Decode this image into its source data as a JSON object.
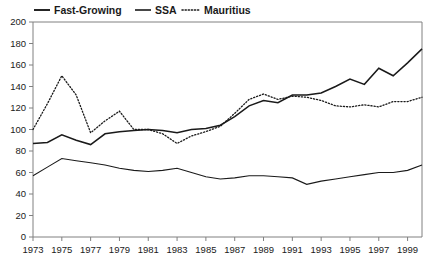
{
  "chart_data": {
    "type": "line",
    "title": "",
    "subtitle": "",
    "xlabel": "",
    "ylabel": "",
    "xlim": [
      1973,
      2000
    ],
    "ylim": [
      0,
      200
    ],
    "ytick_step": 20,
    "xtick_step": 2,
    "grid": false,
    "legend_position": "top-left",
    "yticks": [
      0,
      20,
      40,
      60,
      80,
      100,
      120,
      140,
      160,
      180,
      200
    ],
    "xticks": [
      1973,
      1975,
      1977,
      1979,
      1981,
      1983,
      1985,
      1987,
      1989,
      1991,
      1993,
      1995,
      1997,
      1999
    ],
    "x": [
      1973,
      1974,
      1975,
      1976,
      1977,
      1978,
      1979,
      1980,
      1981,
      1982,
      1983,
      1984,
      1985,
      1986,
      1987,
      1988,
      1989,
      1990,
      1991,
      1992,
      1993,
      1994,
      1995,
      1996,
      1997,
      1998,
      1999,
      2000
    ],
    "series": [
      {
        "name": "Fast-Growing",
        "style": "solid-thick",
        "color": "#1a1a1a",
        "values": [
          87,
          88,
          95,
          90,
          86,
          96,
          98,
          99,
          100,
          99,
          97,
          100,
          101,
          104,
          112,
          122,
          127,
          125,
          132,
          132,
          134,
          140,
          147,
          142,
          157,
          150,
          162,
          175
        ]
      },
      {
        "name": "SSA",
        "style": "solid-thin",
        "color": "#1a1a1a",
        "values": [
          57,
          65,
          73,
          71,
          69,
          67,
          64,
          62,
          61,
          62,
          64,
          60,
          56,
          54,
          55,
          57,
          57,
          56,
          55,
          49,
          52,
          54,
          56,
          58,
          60,
          60,
          62,
          67
        ]
      },
      {
        "name": "Mauritius",
        "style": "dotted",
        "color": "#1a1a1a",
        "values": [
          100,
          124,
          150,
          132,
          97,
          108,
          117,
          100,
          100,
          96,
          87,
          94,
          98,
          103,
          115,
          128,
          133,
          128,
          131,
          130,
          127,
          122,
          121,
          123,
          121,
          126,
          126,
          130
        ]
      }
    ]
  },
  "legend": {
    "items": [
      {
        "label": "Fast-Growing",
        "style": "solid-thick"
      },
      {
        "label": "SSA",
        "style": "solid-thin"
      },
      {
        "label": "Mauritius",
        "style": "dotted"
      }
    ]
  },
  "axes": {
    "y_labels": [
      "200",
      "180",
      "160",
      "140",
      "120",
      "100",
      "80",
      "60",
      "40",
      "20",
      "0"
    ],
    "x_labels": [
      "1973",
      "1975",
      "1977",
      "1979",
      "1981",
      "1983",
      "1985",
      "1987",
      "1989",
      "1991",
      "1993",
      "1995",
      "1997",
      "1999"
    ]
  },
  "colors": {
    "ink": "#1a1a1a",
    "axis": "#808080",
    "background": "#ffffff"
  }
}
